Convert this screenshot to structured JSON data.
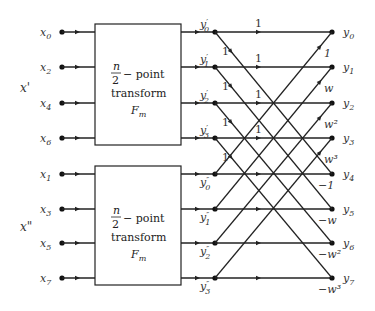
{
  "diagram": {
    "type": "FFT butterfly decomposition",
    "groups": [
      {
        "label": "x'",
        "inputs": [
          "x0",
          "x2",
          "x4",
          "x6"
        ],
        "input_subscripts": [
          "0",
          "2",
          "4",
          "6"
        ],
        "block": {
          "line1_numer": "n",
          "line1_denom": "2",
          "line1_suffix": "− point",
          "line2": "transform",
          "line3_base": "F",
          "line3_sub": "m"
        },
        "outputs": [
          "y'0",
          "y'1",
          "y'2",
          "y'3"
        ],
        "output_subscripts": [
          "0",
          "1",
          "2",
          "3"
        ],
        "prime": "′"
      },
      {
        "label": "x\"",
        "inputs": [
          "x1",
          "x3",
          "x5",
          "x7"
        ],
        "input_subscripts": [
          "1",
          "3",
          "5",
          "7"
        ],
        "block": {
          "line1_numer": "n",
          "line1_denom": "2",
          "line1_suffix": "− point",
          "line2": "transform",
          "line3_base": "F",
          "line3_sub": "m"
        },
        "outputs": [
          "y''0",
          "y''1",
          "y''2",
          "y''3"
        ],
        "output_subscripts": [
          "0",
          "1",
          "2",
          "3"
        ],
        "prime": "″"
      }
    ],
    "final_outputs": [
      "y0",
      "y1",
      "y2",
      "y3",
      "y4",
      "y5",
      "y6",
      "y7"
    ],
    "final_output_subscripts": [
      "0",
      "1",
      "2",
      "3",
      "4",
      "5",
      "6",
      "7"
    ],
    "horizontal_weights_top": [
      "1",
      "1",
      "1",
      "1"
    ],
    "diagonal_weights_down": [
      "1",
      "1",
      "1",
      "1"
    ],
    "twiddle_weights_up": [
      "1",
      "w",
      "w²",
      "w³"
    ],
    "twiddle_weights_bottom": [
      "−1",
      "−w",
      "−w²",
      "−w³"
    ]
  }
}
